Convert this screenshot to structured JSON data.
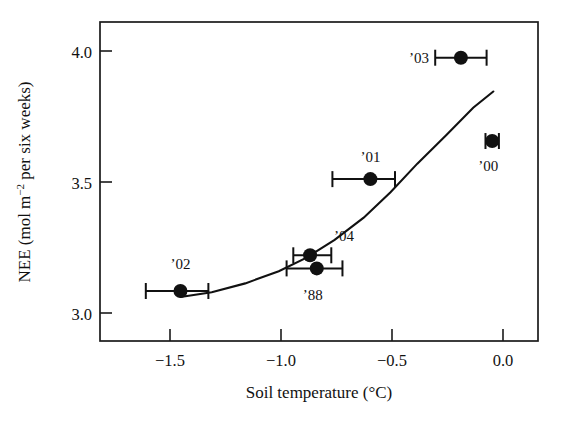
{
  "chart_data": {
    "type": "scatter",
    "title": "",
    "xlabel": "Soil temperature (°C)",
    "ylabel": "NEE (mol m−2 per six weeks)",
    "ylabel_parts": {
      "prefix": "NEE (mol m",
      "superscript": "−2",
      "suffix": " per six weeks)"
    },
    "xlabel_parts": {
      "text": "Soil temperature (°C)"
    },
    "xlim": [
      -1.8,
      0.16
    ],
    "ylim": [
      2.78,
      4.12
    ],
    "xticks": [
      -1.5,
      -1.0,
      -0.5,
      0.0
    ],
    "xtick_labels": [
      "−1.5",
      "−1.0",
      "−0.5",
      "0.0"
    ],
    "yticks": [
      3.0,
      3.5,
      4.0
    ],
    "ytick_labels": [
      "3.0",
      "3.5",
      "4.0"
    ],
    "grid": false,
    "legend": "none",
    "points": [
      {
        "label": "’03",
        "x": -0.185,
        "y": 3.97,
        "xerr_low": -0.3,
        "xerr_high": -0.07,
        "label_dx": -42,
        "label_dy": 5
      },
      {
        "label": "’00",
        "x": -0.045,
        "y": 3.62,
        "xerr_low": -0.075,
        "xerr_high": -0.015,
        "label_dx": -4,
        "label_dy": 30
      },
      {
        "label": "’01",
        "x": -0.59,
        "y": 3.46,
        "xerr_low": -0.76,
        "xerr_high": -0.48,
        "label_dx": 0,
        "label_dy": -17
      },
      {
        "label": "’04",
        "x": -0.86,
        "y": 3.14,
        "xerr_low": -0.935,
        "xerr_high": -0.765,
        "label_dx": 34,
        "label_dy": -14
      },
      {
        "label": "’88",
        "x": -0.83,
        "y": 3.085,
        "xerr_low": -0.965,
        "xerr_high": -0.715,
        "label_dx": -4,
        "label_dy": 32
      },
      {
        "label": "’02",
        "x": -1.44,
        "y": 2.99,
        "xerr_low": -1.595,
        "xerr_high": -1.315,
        "label_dx": 0,
        "label_dy": -22
      }
    ],
    "fit_curve": {
      "description": "exponential-like increasing fit line",
      "x": [
        -1.44,
        -1.3,
        -1.15,
        -1.0,
        -0.88,
        -0.75,
        -0.62,
        -0.5,
        -0.38,
        -0.25,
        -0.13,
        -0.04
      ],
      "y": [
        2.965,
        2.985,
        3.022,
        3.073,
        3.128,
        3.205,
        3.298,
        3.405,
        3.525,
        3.645,
        3.76,
        3.828
      ]
    },
    "colors": {
      "marker": "#111111",
      "curve": "#111111",
      "axis": "#1a1a1a",
      "background": "#ffffff"
    }
  }
}
